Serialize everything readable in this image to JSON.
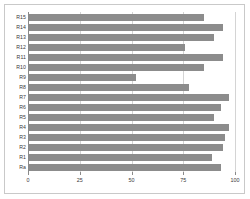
{
  "chart_data": {
    "type": "bar",
    "orientation": "horizontal",
    "title": "",
    "xlabel": "",
    "ylabel": "",
    "xlim": [
      0,
      100
    ],
    "xticks": [
      0,
      25,
      50,
      75,
      100
    ],
    "xticklabels": [
      "0",
      "25",
      "50",
      "75",
      "100"
    ],
    "grid": true,
    "grid_axis": "x",
    "legend": false,
    "bar_color": "#8c8c8c",
    "background_color": "#ffffff",
    "border_color": "#c9c9c9",
    "gridline_color": "#d4d4d4",
    "axis_color": "#8a8a8a",
    "categories": [
      "R15",
      "R14",
      "R13",
      "R12",
      "R11",
      "R10",
      "R9",
      "R8",
      "R7",
      "R6",
      "R5",
      "R4",
      "R3",
      "R2",
      "R1",
      "Ra"
    ],
    "values": [
      85,
      94,
      90,
      76,
      94,
      85,
      52,
      78,
      97,
      93,
      90,
      97,
      95,
      94,
      89,
      93
    ],
    "bars": [
      {
        "category": "R15",
        "value": 85
      },
      {
        "category": "R14",
        "value": 94
      },
      {
        "category": "R13",
        "value": 90
      },
      {
        "category": "R12",
        "value": 76
      },
      {
        "category": "R11",
        "value": 94
      },
      {
        "category": "R10",
        "value": 85
      },
      {
        "category": "R9",
        "value": 52
      },
      {
        "category": "R8",
        "value": 78
      },
      {
        "category": "R7",
        "value": 97
      },
      {
        "category": "R6",
        "value": 93
      },
      {
        "category": "R5",
        "value": 90
      },
      {
        "category": "R4",
        "value": 97
      },
      {
        "category": "R3",
        "value": 95
      },
      {
        "category": "R2",
        "value": 94
      },
      {
        "category": "R1",
        "value": 89
      },
      {
        "category": "Ra",
        "value": 93
      }
    ]
  }
}
